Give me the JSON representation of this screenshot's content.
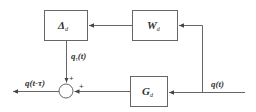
{
  "diagram": {
    "type": "block-diagram",
    "blocks": [
      {
        "id": "delta",
        "symbol": "Δ",
        "subscript": "d"
      },
      {
        "id": "w",
        "symbol": "W",
        "subscript": "d"
      },
      {
        "id": "g",
        "symbol": "G",
        "subscript": "d"
      }
    ],
    "signals": {
      "input": "q(t)",
      "output": "q(t-τ)",
      "delta_out_main": "q",
      "delta_out_sub": "τ",
      "delta_out_arg": "(t)"
    },
    "summing_junction": {
      "top_sign": "+",
      "right_sign": "+"
    },
    "line_color": "#555555",
    "text_color": "#333333"
  }
}
